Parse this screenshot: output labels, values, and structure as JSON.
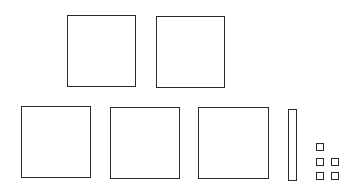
{
  "diagram": {
    "type": "base-ten-blocks",
    "stroke_color": "#2a2a2a",
    "background": "#ffffff",
    "counts": {
      "hundreds": 5,
      "tens": 1,
      "ones": 5
    },
    "hundreds": [
      {
        "x": 67,
        "y": 15,
        "w": 69,
        "h": 72
      },
      {
        "x": 156,
        "y": 16,
        "w": 69,
        "h": 72
      },
      {
        "x": 21,
        "y": 106,
        "w": 70,
        "h": 72
      },
      {
        "x": 110,
        "y": 107,
        "w": 70,
        "h": 72
      },
      {
        "x": 198,
        "y": 107,
        "w": 71,
        "h": 72
      }
    ],
    "tens": [
      {
        "x": 288,
        "y": 109,
        "w": 9,
        "h": 72
      }
    ],
    "ones": [
      {
        "x": 316,
        "y": 143,
        "w": 8,
        "h": 8
      },
      {
        "x": 316,
        "y": 158,
        "w": 8,
        "h": 8
      },
      {
        "x": 331,
        "y": 158,
        "w": 8,
        "h": 8
      },
      {
        "x": 316,
        "y": 172,
        "w": 8,
        "h": 8
      },
      {
        "x": 331,
        "y": 172,
        "w": 8,
        "h": 8
      }
    ]
  }
}
